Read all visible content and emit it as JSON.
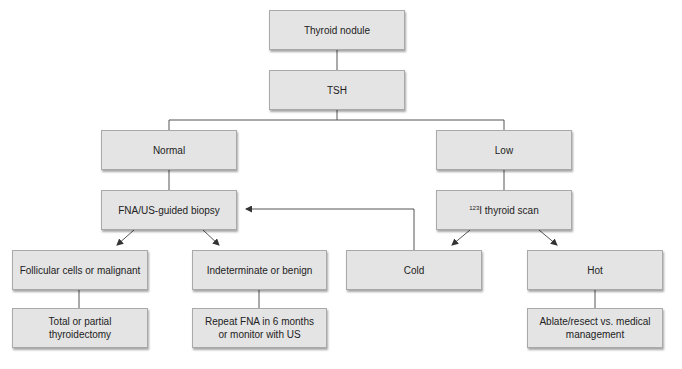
{
  "diagram": {
    "type": "flowchart",
    "nodes": {
      "root": {
        "label": "Thyroid nodule"
      },
      "tsh": {
        "label": "TSH"
      },
      "normal": {
        "label": "Normal"
      },
      "low": {
        "label": "Low"
      },
      "fna": {
        "label": "FNA/US-guided biopsy"
      },
      "scan": {
        "superscript": "123",
        "label": "I thyroid scan"
      },
      "follicular": {
        "label": "Follicular cells or malignant"
      },
      "indeterminate": {
        "label": "Indeterminate or benign"
      },
      "cold": {
        "label": "Cold"
      },
      "hot": {
        "label": "Hot"
      },
      "thyroidectomy": {
        "label": "Total or partial thyroidectomy"
      },
      "repeat_line1": {
        "label": "Repeat FNA in 6 months"
      },
      "repeat_line2": {
        "label": "or monitor with US"
      },
      "ablate_line1": {
        "label": "Ablate/resect vs. medical"
      },
      "ablate_line2": {
        "label": "management"
      }
    },
    "edges": [
      {
        "from": "Thyroid nodule",
        "to": "TSH",
        "style": "line"
      },
      {
        "from": "TSH",
        "to": "Normal",
        "style": "line"
      },
      {
        "from": "TSH",
        "to": "Low",
        "style": "line"
      },
      {
        "from": "Normal",
        "to": "FNA/US-guided biopsy",
        "style": "line"
      },
      {
        "from": "Low",
        "to": "123I thyroid scan",
        "style": "line"
      },
      {
        "from": "FNA/US-guided biopsy",
        "to": "Follicular cells or malignant",
        "style": "arrow"
      },
      {
        "from": "FNA/US-guided biopsy",
        "to": "Indeterminate or benign",
        "style": "arrow"
      },
      {
        "from": "123I thyroid scan",
        "to": "Cold",
        "style": "arrow"
      },
      {
        "from": "123I thyroid scan",
        "to": "Hot",
        "style": "arrow"
      },
      {
        "from": "Cold",
        "to": "FNA/US-guided biopsy",
        "style": "arrow"
      },
      {
        "from": "Follicular cells or malignant",
        "to": "Total or partial thyroidectomy",
        "style": "line"
      },
      {
        "from": "Indeterminate or benign",
        "to": "Repeat FNA in 6 months or monitor with US",
        "style": "line"
      },
      {
        "from": "Hot",
        "to": "Ablate/resect vs. medical management",
        "style": "line"
      }
    ],
    "colors": {
      "box_fill": "#e4e4e4",
      "box_border": "#a9a9a9",
      "line": "#555555"
    }
  }
}
